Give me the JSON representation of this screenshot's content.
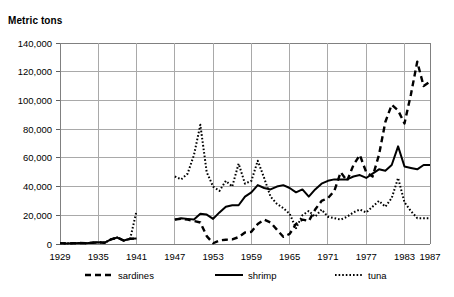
{
  "chart_data": {
    "type": "line",
    "title": "",
    "ylabel": "Metric tons",
    "xlabel": "",
    "ylim": [
      0,
      140000
    ],
    "ytick_step": 20000,
    "ytick_labels": [
      "140,000",
      "120,000",
      "100,000",
      "80,000",
      "60,000",
      "40,000",
      "20,000",
      "0"
    ],
    "ytick_values": [
      140000,
      120000,
      100000,
      80000,
      60000,
      40000,
      20000,
      0
    ],
    "xlim": [
      1929,
      1987
    ],
    "xtick_labels": [
      "1929",
      "1935",
      "1941",
      "1947",
      "1953",
      "1959",
      "1965",
      "1971",
      "1977",
      "1983",
      "1987"
    ],
    "xtick_values": [
      1929,
      1935,
      1941,
      1947,
      1953,
      1959,
      1965,
      1971,
      1977,
      1983,
      1987
    ],
    "grid": true,
    "legend_position": "bottom",
    "data_gap_years": [
      1942,
      1943,
      1944,
      1945,
      1946
    ],
    "series": [
      {
        "name": "sardines",
        "style": "dashed",
        "color": "#000000",
        "x": [
          1929,
          1930,
          1931,
          1932,
          1933,
          1934,
          1935,
          1936,
          1937,
          1938,
          1939,
          1940,
          1941,
          1947,
          1948,
          1949,
          1950,
          1951,
          1952,
          1953,
          1954,
          1955,
          1956,
          1957,
          1958,
          1959,
          1960,
          1961,
          1962,
          1963,
          1964,
          1965,
          1966,
          1967,
          1968,
          1969,
          1970,
          1971,
          1972,
          1973,
          1974,
          1975,
          1976,
          1977,
          1978,
          1979,
          1980,
          1981,
          1982,
          1983,
          1984,
          1985,
          1986,
          1987
        ],
        "values": [
          600,
          400,
          500,
          700,
          600,
          900,
          1200,
          900,
          3200,
          4500,
          2400,
          3600,
          3800,
          17000,
          17500,
          17000,
          16000,
          15000,
          5500,
          500,
          2500,
          3000,
          3200,
          4800,
          8000,
          8500,
          14000,
          17000,
          15000,
          10000,
          5000,
          7000,
          14000,
          17000,
          16000,
          24000,
          30000,
          32000,
          37000,
          50000,
          44000,
          55000,
          62000,
          50000,
          47000,
          62000,
          85000,
          97000,
          93000,
          84000,
          104000,
          127000,
          110000,
          113000
        ]
      },
      {
        "name": "shrimp",
        "style": "solid",
        "color": "#000000",
        "x": [
          1929,
          1930,
          1931,
          1932,
          1933,
          1934,
          1935,
          1936,
          1937,
          1938,
          1939,
          1940,
          1941,
          1947,
          1948,
          1949,
          1950,
          1951,
          1952,
          1953,
          1954,
          1955,
          1956,
          1957,
          1958,
          1959,
          1960,
          1961,
          1962,
          1963,
          1964,
          1965,
          1966,
          1967,
          1968,
          1969,
          1970,
          1971,
          1972,
          1973,
          1974,
          1975,
          1976,
          1977,
          1978,
          1979,
          1980,
          1981,
          1982,
          1983,
          1984,
          1985,
          1986,
          1987
        ],
        "values": [
          600,
          400,
          500,
          700,
          600,
          900,
          1200,
          900,
          3200,
          4500,
          2400,
          3600,
          3800,
          17000,
          18000,
          17500,
          17000,
          21000,
          20500,
          17500,
          22000,
          26000,
          27000,
          27000,
          33000,
          36000,
          41000,
          39000,
          38000,
          40000,
          41000,
          39000,
          36000,
          38000,
          33000,
          38000,
          42000,
          44000,
          45000,
          45000,
          45000,
          47000,
          48000,
          46000,
          49000,
          52000,
          51000,
          55000,
          68000,
          54000,
          53000,
          52000,
          55000,
          55000
        ]
      },
      {
        "name": "tuna",
        "style": "dotted",
        "color": "#000000",
        "x": [
          1929,
          1930,
          1931,
          1932,
          1933,
          1934,
          1935,
          1936,
          1937,
          1938,
          1939,
          1940,
          1941,
          1947,
          1948,
          1949,
          1950,
          1951,
          1952,
          1953,
          1954,
          1955,
          1956,
          1957,
          1958,
          1959,
          1960,
          1961,
          1962,
          1963,
          1964,
          1965,
          1966,
          1967,
          1968,
          1969,
          1970,
          1971,
          1972,
          1973,
          1974,
          1975,
          1976,
          1977,
          1978,
          1979,
          1980,
          1981,
          1982,
          1983,
          1984,
          1985,
          1986,
          1987
        ],
        "values": [
          600,
          400,
          500,
          700,
          600,
          900,
          1200,
          900,
          3200,
          4500,
          2400,
          3600,
          23000,
          47000,
          45000,
          49000,
          62000,
          83000,
          50000,
          40000,
          37000,
          44000,
          40000,
          56000,
          42000,
          44000,
          58000,
          46000,
          33000,
          28000,
          25000,
          21000,
          11000,
          20000,
          23000,
          19000,
          24000,
          19000,
          18000,
          17000,
          19000,
          22000,
          24000,
          22000,
          26000,
          30000,
          26000,
          32000,
          46000,
          29000,
          23000,
          18000,
          18000,
          18000
        ]
      }
    ]
  },
  "legend": {
    "items": [
      {
        "label": "sardines",
        "style": "dashed"
      },
      {
        "label": "shrimp",
        "style": "solid"
      },
      {
        "label": "tuna",
        "style": "dotted"
      }
    ]
  }
}
